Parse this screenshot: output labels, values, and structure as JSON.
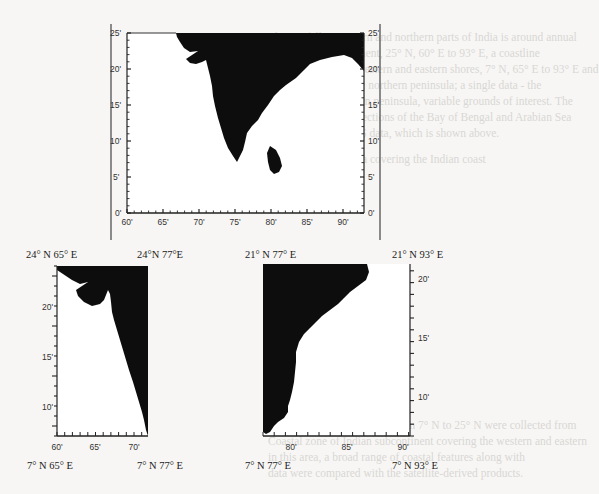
{
  "page": {
    "background_color": "#f7f6f4",
    "land_color": "#0d0d0d",
    "bleed_through_text": [
      "The rainfall in western and northern parts of India is around annual",
      "The Indian subcontinent, 25° N, 60° E to 93° E, a coastline",
      "extending over the western and eastern shores, 7° N, 65° E to 93° E and",
      "coastal regions in the northern peninsula; a single data - the",
      "coast and the southern peninsula, variable grounds of interest. The",
      "analysis of the two sections of the Bay of Bengal and Arabian Sea",
      "of the Indian MODIS data, which is shown above.",
      "Figure 1.2 Study area covering the Indian coast",
      "1.2 STUDY AREA",
      "Study area of this research from 7° N to 25° N were collected from",
      "Coastal zone of Indian subcontinent covering the western and eastern",
      "in this area, a broad range of coastal features along with",
      "data were compared with the satellite-derived products."
    ]
  },
  "figure_top": {
    "name": "Indian subcontinent overview map",
    "x_ticks": [
      "60'",
      "65'",
      "70'",
      "75'",
      "80'",
      "85'",
      "90'"
    ],
    "y_ticks_left": [
      "0'",
      "5'",
      "10'",
      "15'",
      "20'",
      "25'"
    ],
    "y_ticks_right": [
      "0'",
      "5'",
      "10'",
      "15'",
      "20'",
      "25'"
    ]
  },
  "figure_west": {
    "name": "West coast of India map",
    "top_left_label": "24° N 65° E",
    "top_right_label": "24°N 77°E",
    "bottom_left_label": "7° N 65° E",
    "bottom_right_label": "7° N 77° E",
    "x_ticks": [
      "60'",
      "65'",
      "70'"
    ],
    "y_ticks": [
      "10'",
      "15'",
      "20'"
    ]
  },
  "figure_east": {
    "name": "East coast of India map",
    "top_left_label": "21° N 77° E",
    "top_right_label": "21° N 93° E",
    "bottom_left_label": "7° N 77° E",
    "bottom_right_label": "7° N 93° E",
    "x_ticks": [
      "80'",
      "85'",
      "90'"
    ],
    "y_ticks": [
      "10'",
      "15'",
      "20'"
    ]
  }
}
